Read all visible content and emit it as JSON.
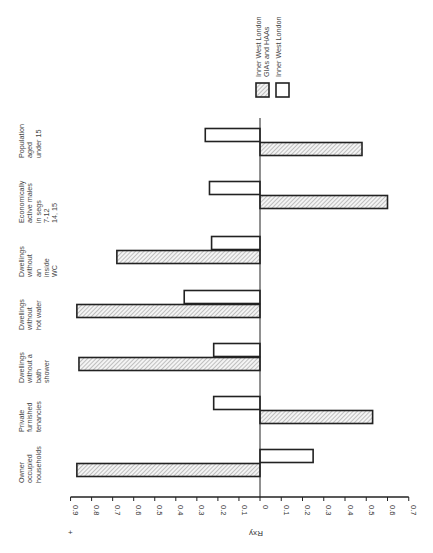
{
  "chart_data": {
    "type": "bar",
    "orientation": "rotated 90° counter-clockwise (horizontal bars, labels read bottom-to-top)",
    "title": "",
    "xlabel": "",
    "ylabel": "Rxy",
    "sign_marker": "+",
    "axis": {
      "positive_side": "left",
      "ticks_positive": [
        "0.9",
        "0.8",
        "0.7",
        "0.6",
        "0.5",
        "0.4",
        "0.3",
        "0.2",
        "0.1"
      ],
      "zero": "0",
      "ticks_negative": [
        "0.1",
        "0.2",
        "0.3",
        "0.4",
        "0.5",
        "0.6",
        "0.7"
      ],
      "range": [
        -0.7,
        0.9
      ]
    },
    "categories": [
      [
        "Owner",
        "occupied",
        "households"
      ],
      [
        "Private",
        "furnished",
        "tenancies"
      ],
      [
        "Dwellings",
        "without a",
        "bath",
        "shower"
      ],
      [
        "Dwellings",
        "without",
        "hot water"
      ],
      [
        "Dwellings",
        "without",
        "an",
        "inside",
        "WC"
      ],
      [
        "Economically",
        "active males",
        "in segs",
        "7-12",
        "14, 15"
      ],
      [
        "Population",
        "aged",
        "under 15"
      ]
    ],
    "series": [
      {
        "name": "Inner West London GIAs and HAAs",
        "pattern": "hatched",
        "values": [
          0.87,
          -0.53,
          0.86,
          0.87,
          0.68,
          -0.6,
          -0.48
        ]
      },
      {
        "name": "Inner West London",
        "pattern": "open",
        "values": [
          -0.25,
          0.22,
          0.22,
          0.36,
          0.23,
          0.24,
          0.26
        ]
      }
    ],
    "legend": {
      "placement": "top-right",
      "entries": [
        {
          "lines": [
            "Inner West London",
            "GIAs and HAAs"
          ],
          "pattern": "hatched"
        },
        {
          "lines": [
            "Inner West London"
          ],
          "pattern": "open"
        }
      ]
    },
    "colors": {
      "stroke": "#222222",
      "hatch": "#888888",
      "text": "#444444"
    }
  }
}
